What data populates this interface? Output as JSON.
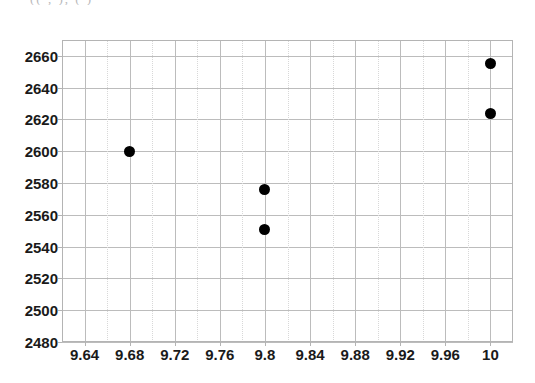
{
  "figure": {
    "title_fragment": "((       ,   ), (                      )",
    "background_color": "#ffffff",
    "marker_color": "#000000",
    "gridline_color": "#bcbcbc",
    "minor_gridline_color": "#d8d8d8"
  },
  "chart_data": {
    "type": "scatter",
    "title": "",
    "xlabel": "",
    "ylabel": "",
    "xlim": [
      9.62,
      10.02
    ],
    "ylim": [
      2480,
      2670
    ],
    "grid": true,
    "legend": "none",
    "xticks": [
      9.64,
      9.68,
      9.72,
      9.76,
      9.8,
      9.84,
      9.88,
      9.92,
      9.96,
      10
    ],
    "xticklabels": [
      "9.64",
      "9.68",
      "9.72",
      "9.76",
      "9.8",
      "9.84",
      "9.88",
      "9.92",
      "9.96",
      "10"
    ],
    "yticks": [
      2480,
      2500,
      2520,
      2540,
      2560,
      2580,
      2600,
      2620,
      2640,
      2660
    ],
    "yticklabels": [
      "2480",
      "2500",
      "2520",
      "2540",
      "2560",
      "2580",
      "2600",
      "2620",
      "2640",
      "2660"
    ],
    "x_minor_step": 0.02,
    "y_minor": false,
    "points": [
      {
        "x": 9.68,
        "y": 2600
      },
      {
        "x": 9.8,
        "y": 2576
      },
      {
        "x": 9.8,
        "y": 2551
      },
      {
        "x": 10,
        "y": 2655
      },
      {
        "x": 10,
        "y": 2624
      }
    ]
  }
}
